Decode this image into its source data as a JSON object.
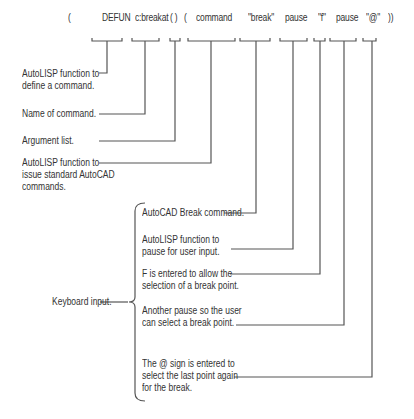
{
  "code_tokens": [
    {
      "id": "open-paren-1",
      "text": "("
    },
    {
      "id": "defun",
      "text": "DEFUN"
    },
    {
      "id": "cbreakat",
      "text": "c:breakat"
    },
    {
      "id": "arg-list",
      "text": "(  )"
    },
    {
      "id": "open-paren-2",
      "text": "("
    },
    {
      "id": "command",
      "text": "command"
    },
    {
      "id": "break-str",
      "text": "\"break\""
    },
    {
      "id": "pause-1",
      "text": "pause"
    },
    {
      "id": "f-str",
      "text": "\"f\""
    },
    {
      "id": "pause-2",
      "text": "pause"
    },
    {
      "id": "at-str",
      "text": "\"@\""
    },
    {
      "id": "close-parens",
      "text": "))"
    }
  ],
  "annotations": {
    "defun": "AutoLISP function to\ndefine a command.",
    "name": "Name of command.",
    "args": "Argument list.",
    "command": "AutoLISP function to\nissue standard AutoCAD\ncommands.",
    "break": "AutoCAD Break command.",
    "pause1": "AutoLISP function to\npause for user input.",
    "f": "F is entered to allow the\nselection of a break point.",
    "pause2": "Another pause so the user\ncan select a break point.",
    "at": "The @ sign is entered to\nselect the last point again\nfor the break.",
    "group": "Keyboard input."
  }
}
